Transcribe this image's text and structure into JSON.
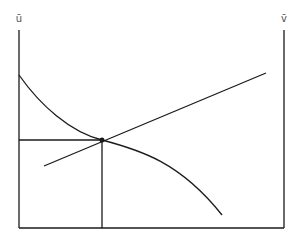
{
  "diagram": {
    "type": "two-axis equilibrium diagram",
    "labels": {
      "left_axis": "ū",
      "right_axis": "v̄"
    },
    "colors": {
      "line": "#1a1a1a",
      "label": "#555555",
      "background": "#ffffff"
    },
    "elements": [
      {
        "name": "left-axis",
        "kind": "vertical axis",
        "label": "ū"
      },
      {
        "name": "right-axis",
        "kind": "vertical axis",
        "label": "v̄"
      },
      {
        "name": "baseline",
        "kind": "horizontal axis"
      },
      {
        "name": "decreasing-curve",
        "kind": "convex-then-concave downward curve"
      },
      {
        "name": "increasing-line",
        "kind": "upward-sloping straight line"
      },
      {
        "name": "intersection-point",
        "kind": "equilibrium point"
      },
      {
        "name": "horizontal-projection",
        "kind": "guide line to left axis"
      },
      {
        "name": "vertical-projection",
        "kind": "guide line to baseline"
      }
    ]
  }
}
